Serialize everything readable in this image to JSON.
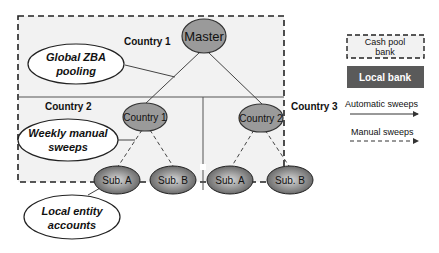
{
  "diagram": {
    "regions": {
      "country1": "Country 1",
      "country2": "Country 2",
      "country3": "Country 3"
    },
    "nodes": {
      "master": "Master",
      "country1": "Country 1",
      "country2": "Country 2",
      "sub_a_1": "Sub. A",
      "sub_b_1": "Sub. B",
      "sub_a_2": "Sub. A",
      "sub_b_2": "Sub. B"
    },
    "callouts": {
      "global_zba": [
        "Global ZBA",
        "pooling"
      ],
      "weekly_manual": [
        "Weekly manual",
        "sweeps"
      ],
      "local_entity": [
        "Local  entity",
        "accounts"
      ]
    },
    "legend": {
      "cash_pool_bank": [
        "Cash pool",
        "bank"
      ],
      "local_bank": "Local bank",
      "automatic_sweeps": "Automatic sweeps",
      "manual_sweeps": "Manual sweeps"
    },
    "colors": {
      "region_fill": "#f2f2f2",
      "node_fill": "#9a9a9a",
      "local_bank_fill": "#5a5a5a"
    }
  }
}
